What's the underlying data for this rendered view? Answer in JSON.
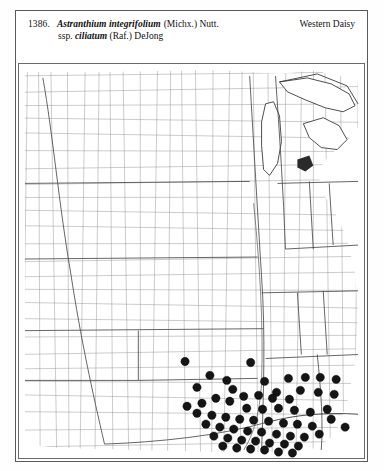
{
  "plate": {
    "number": "1386.",
    "taxon": "Astranthium integrifolium",
    "authority": "(Michx.) Nutt.",
    "subspecies_prefix": "ssp.",
    "subspecies": "ciliatum",
    "subspecies_authority": "(Raf.) DeJong",
    "common_name": "Western Daisy"
  },
  "map": {
    "type": "dot-distribution-range-map",
    "region": "central and eastern United States, county level",
    "symbol": "filled-black-circle",
    "symbol_meaning": "documented county occurrence",
    "dot_radius_px": 4.2,
    "occurrence_count": 62,
    "colors": {
      "dot": "#151515",
      "county_line": "#8d8d8d",
      "state_line": "#4a4a4a",
      "coastline": "#3a3a3a",
      "background": "#ffffff"
    },
    "occurrences": [
      [
        184,
        361
      ],
      [
        226,
        380
      ],
      [
        250,
        362
      ],
      [
        209,
        375
      ],
      [
        196,
        387
      ],
      [
        232,
        389
      ],
      [
        264,
        381
      ],
      [
        288,
        378
      ],
      [
        305,
        377
      ],
      [
        320,
        377
      ],
      [
        336,
        379
      ],
      [
        276,
        392
      ],
      [
        300,
        390
      ],
      [
        318,
        392
      ],
      [
        334,
        394
      ],
      [
        243,
        396
      ],
      [
        258,
        395
      ],
      [
        272,
        398
      ],
      [
        289,
        399
      ],
      [
        215,
        398
      ],
      [
        229,
        401
      ],
      [
        201,
        403
      ],
      [
        186,
        406
      ],
      [
        246,
        408
      ],
      [
        262,
        409
      ],
      [
        278,
        408
      ],
      [
        294,
        410
      ],
      [
        310,
        412
      ],
      [
        327,
        409
      ],
      [
        196,
        413
      ],
      [
        211,
        415
      ],
      [
        225,
        417
      ],
      [
        239,
        419
      ],
      [
        253,
        420
      ],
      [
        268,
        421
      ],
      [
        283,
        423
      ],
      [
        297,
        424
      ],
      [
        312,
        426
      ],
      [
        205,
        424
      ],
      [
        219,
        427
      ],
      [
        233,
        429
      ],
      [
        247,
        431
      ],
      [
        261,
        432
      ],
      [
        276,
        434
      ],
      [
        290,
        436
      ],
      [
        304,
        437
      ],
      [
        319,
        434
      ],
      [
        213,
        436
      ],
      [
        227,
        438
      ],
      [
        241,
        440
      ],
      [
        255,
        441
      ],
      [
        269,
        443
      ],
      [
        284,
        444
      ],
      [
        298,
        446
      ],
      [
        222,
        446
      ],
      [
        236,
        448
      ],
      [
        250,
        449
      ],
      [
        264,
        450
      ],
      [
        278,
        452
      ],
      [
        292,
        453
      ],
      [
        331,
        419
      ],
      [
        345,
        427
      ]
    ]
  }
}
